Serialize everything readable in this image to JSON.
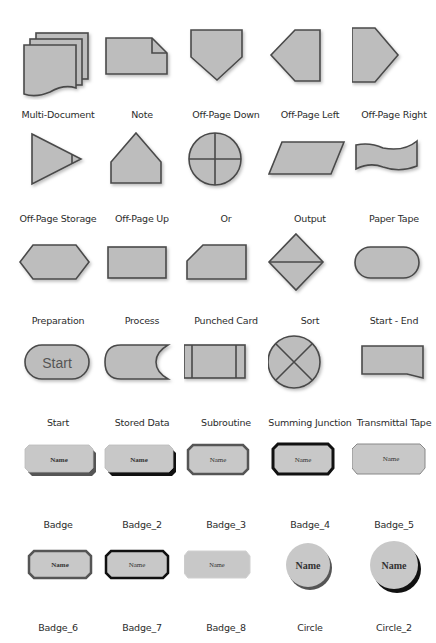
{
  "colors": {
    "fill": "#bdbdbd",
    "stroke": "#4a4a4a",
    "badge_fill": "#c8c8c8",
    "text": "#2c2c2c"
  },
  "shapes": [
    {
      "label": "Multi-Document"
    },
    {
      "label": "Note"
    },
    {
      "label": "Off-Page Down"
    },
    {
      "label": "Off-Page Left"
    },
    {
      "label": "Off-Page Right"
    },
    {
      "label": "Off-Page Storage"
    },
    {
      "label": "Off-Page Up"
    },
    {
      "label": "Or"
    },
    {
      "label": "Output"
    },
    {
      "label": "Paper Tape"
    },
    {
      "label": "Preparation"
    },
    {
      "label": "Process"
    },
    {
      "label": "Punched Card"
    },
    {
      "label": "Sort"
    },
    {
      "label": "Start - End"
    },
    {
      "label": "Start",
      "inner_text": "Start"
    },
    {
      "label": "Stored Data"
    },
    {
      "label": "Subroutine"
    },
    {
      "label": "Summing Junction"
    },
    {
      "label": "Transmittal Tape"
    },
    {
      "label": "Badge",
      "inner_text": "Name"
    },
    {
      "label": "Badge_2",
      "inner_text": "Name"
    },
    {
      "label": "Badge_3",
      "inner_text": "Name"
    },
    {
      "label": "Badge_4",
      "inner_text": "Name"
    },
    {
      "label": "Badge_5",
      "inner_text": "Name"
    },
    {
      "label": "Badge_6",
      "inner_text": "Name"
    },
    {
      "label": "Badge_7",
      "inner_text": "Name"
    },
    {
      "label": "Badge_8",
      "inner_text": "Name"
    },
    {
      "label": "Circle",
      "inner_text": "Name"
    },
    {
      "label": "Circle_2",
      "inner_text": "Name"
    }
  ]
}
